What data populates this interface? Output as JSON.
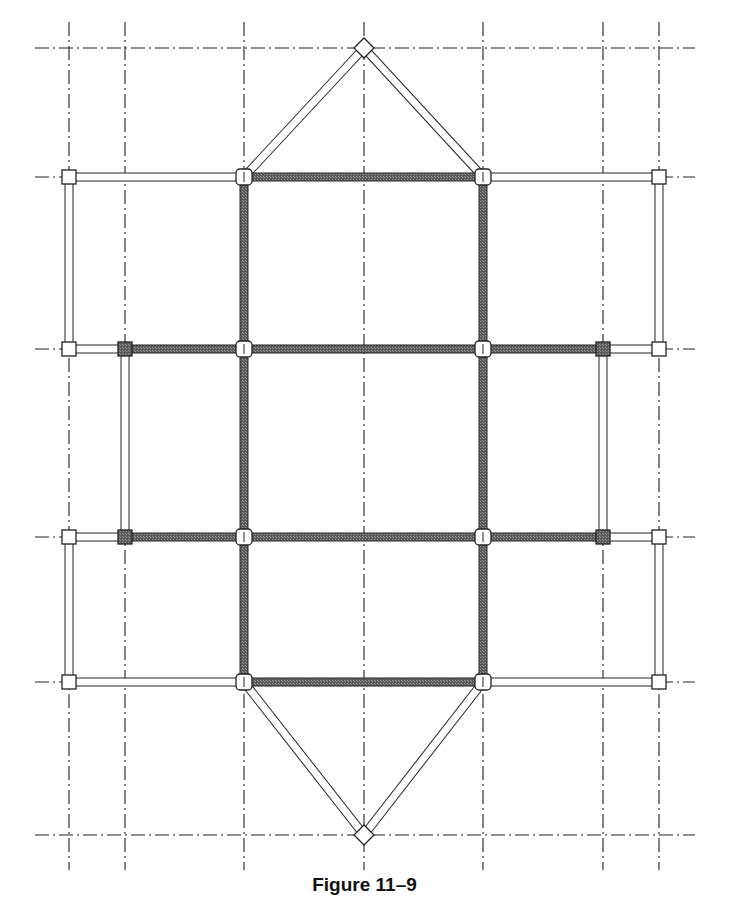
{
  "figure": {
    "caption": "Figure 11–9",
    "corner_fragment": "g"
  },
  "colors": {
    "background": "#ffffff",
    "grid_line": "#222222",
    "beam_primary_fill": "#6e6e6e",
    "beam_secondary_fill": "#ffffff",
    "outline": "#222222",
    "column_hatched_fill": "#8a8a8a"
  },
  "grid": {
    "vertical_x": [
      69,
      125,
      244,
      364,
      483,
      603,
      659
    ],
    "horizontal_y": [
      48,
      177,
      349,
      537,
      682,
      835
    ],
    "x_extent": [
      35,
      695
    ],
    "y_extent": [
      22,
      870
    ]
  },
  "beams_primary": [
    {
      "x1": 244,
      "y1": 177,
      "x2": 483,
      "y2": 177
    },
    {
      "x1": 125,
      "y1": 349,
      "x2": 603,
      "y2": 349
    },
    {
      "x1": 125,
      "y1": 537,
      "x2": 603,
      "y2": 537
    },
    {
      "x1": 244,
      "y1": 682,
      "x2": 483,
      "y2": 682
    },
    {
      "x1": 244,
      "y1": 177,
      "x2": 244,
      "y2": 682
    },
    {
      "x1": 483,
      "y1": 177,
      "x2": 483,
      "y2": 682
    }
  ],
  "beams_secondary": [
    {
      "x1": 69,
      "y1": 177,
      "x2": 244,
      "y2": 177
    },
    {
      "x1": 483,
      "y1": 177,
      "x2": 659,
      "y2": 177
    },
    {
      "x1": 69,
      "y1": 177,
      "x2": 69,
      "y2": 349
    },
    {
      "x1": 659,
      "y1": 177,
      "x2": 659,
      "y2": 349
    },
    {
      "x1": 69,
      "y1": 349,
      "x2": 125,
      "y2": 349
    },
    {
      "x1": 603,
      "y1": 349,
      "x2": 659,
      "y2": 349
    },
    {
      "x1": 125,
      "y1": 349,
      "x2": 125,
      "y2": 537
    },
    {
      "x1": 603,
      "y1": 349,
      "x2": 603,
      "y2": 537
    },
    {
      "x1": 69,
      "y1": 537,
      "x2": 125,
      "y2": 537
    },
    {
      "x1": 603,
      "y1": 537,
      "x2": 659,
      "y2": 537
    },
    {
      "x1": 69,
      "y1": 537,
      "x2": 69,
      "y2": 682
    },
    {
      "x1": 659,
      "y1": 537,
      "x2": 659,
      "y2": 682
    },
    {
      "x1": 69,
      "y1": 682,
      "x2": 244,
      "y2": 682
    },
    {
      "x1": 483,
      "y1": 682,
      "x2": 659,
      "y2": 682
    },
    {
      "x1": 244,
      "y1": 177,
      "x2": 364,
      "y2": 48
    },
    {
      "x1": 483,
      "y1": 177,
      "x2": 364,
      "y2": 48
    },
    {
      "x1": 244,
      "y1": 682,
      "x2": 364,
      "y2": 835
    },
    {
      "x1": 483,
      "y1": 682,
      "x2": 364,
      "y2": 835
    }
  ],
  "columns_square": [
    {
      "x": 69,
      "y": 177
    },
    {
      "x": 659,
      "y": 177
    },
    {
      "x": 69,
      "y": 349
    },
    {
      "x": 659,
      "y": 349
    },
    {
      "x": 69,
      "y": 537
    },
    {
      "x": 659,
      "y": 537
    },
    {
      "x": 69,
      "y": 682
    },
    {
      "x": 659,
      "y": 682
    }
  ],
  "columns_hatched": [
    {
      "x": 125,
      "y": 349
    },
    {
      "x": 603,
      "y": 349
    },
    {
      "x": 125,
      "y": 537
    },
    {
      "x": 603,
      "y": 537
    }
  ],
  "columns_round": [
    {
      "x": 244,
      "y": 177
    },
    {
      "x": 483,
      "y": 177
    },
    {
      "x": 244,
      "y": 349
    },
    {
      "x": 483,
      "y": 349
    },
    {
      "x": 244,
      "y": 537
    },
    {
      "x": 483,
      "y": 537
    },
    {
      "x": 244,
      "y": 682
    },
    {
      "x": 483,
      "y": 682
    }
  ],
  "columns_diamond": [
    {
      "x": 364,
      "y": 48
    },
    {
      "x": 364,
      "y": 835
    }
  ]
}
